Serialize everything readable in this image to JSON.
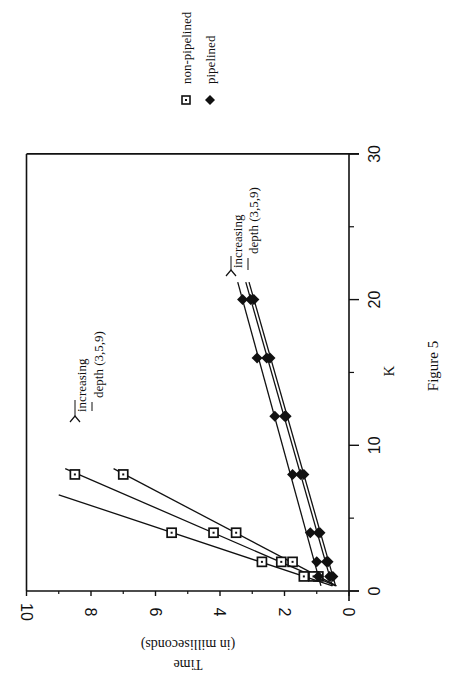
{
  "figure": {
    "caption": "Figure 5",
    "orientation": "rotated 90 degrees clockwise"
  },
  "legend": {
    "items": [
      {
        "label": "non-pipelined",
        "marker": "square-dot-icon"
      },
      {
        "label": "pipelined",
        "marker": "filled-diamond-icon"
      }
    ]
  },
  "annotations": [
    {
      "line1": "increasing",
      "line2": "depth (3,5,9)",
      "target": "non-pipelined"
    },
    {
      "line1": "increasing",
      "line2": "depth (3,5,9)",
      "target": "pipelined"
    }
  ],
  "axes": {
    "x": {
      "label": "K",
      "ticks": [
        "0",
        "10",
        "20",
        "30"
      ]
    },
    "y": {
      "label_line1": "Time",
      "label_line2": "(in milliseconds)",
      "ticks": [
        "0",
        "2",
        "4",
        "6",
        "8",
        "10"
      ]
    }
  },
  "chart_data": {
    "type": "line",
    "title": "Figure 5",
    "xlabel": "K",
    "ylabel": "Time (in milliseconds)",
    "xlim": [
      0,
      30
    ],
    "ylim": [
      0,
      10
    ],
    "x_ticks": [
      0,
      10,
      20,
      30
    ],
    "x_minor_ticks": [
      5,
      15,
      25
    ],
    "y_ticks": [
      0,
      2,
      4,
      6,
      8,
      10
    ],
    "y_minor_ticks": [
      1,
      3,
      5,
      7,
      9
    ],
    "grid": false,
    "legend_position": "top-right (rotated)",
    "series": [
      {
        "name": "non-pipelined, depth 3",
        "marker": "square",
        "x": [
          1,
          2,
          4,
          8
        ],
        "y": [
          0.95,
          1.75,
          3.5,
          7.0
        ],
        "line_extends_to": {
          "x": 8.4,
          "y": 7.3
        }
      },
      {
        "name": "non-pipelined, depth 5",
        "marker": "square",
        "x": [
          1,
          2,
          4,
          8
        ],
        "y": [
          1.1,
          2.1,
          4.2,
          8.5
        ],
        "line_extends_to": {
          "x": 8.4,
          "y": 8.8
        }
      },
      {
        "name": "non-pipelined, depth 9",
        "marker": "square",
        "x": [
          1,
          2,
          4
        ],
        "y": [
          1.4,
          2.7,
          5.5
        ],
        "line_extends_to": {
          "x": 6.6,
          "y": 9.0
        }
      },
      {
        "name": "pipelined, depth 3",
        "marker": "diamond",
        "x": [
          1,
          2,
          4,
          8,
          12,
          16,
          20
        ],
        "y": [
          0.5,
          0.65,
          0.9,
          1.4,
          1.95,
          2.45,
          2.95
        ],
        "line_extends_to": {
          "x": 21.2,
          "y": 3.1
        }
      },
      {
        "name": "pipelined, depth 5",
        "marker": "diamond",
        "x": [
          1,
          2,
          4,
          8,
          12,
          16,
          20
        ],
        "y": [
          0.6,
          0.7,
          0.95,
          1.5,
          2.0,
          2.55,
          3.05
        ],
        "line_extends_to": {
          "x": 21.2,
          "y": 3.2
        }
      },
      {
        "name": "pipelined, depth 9",
        "marker": "diamond",
        "x": [
          1,
          2,
          4,
          8,
          12,
          16,
          20
        ],
        "y": [
          0.95,
          1.0,
          1.2,
          1.75,
          2.3,
          2.85,
          3.3
        ],
        "line_extends_to": {
          "x": 21.2,
          "y": 3.45
        }
      }
    ],
    "annotations": [
      {
        "text": "increasing depth (3,5,9)",
        "near": "non-pipelined lines",
        "at": {
          "x": 10.5,
          "y": 8.6
        }
      },
      {
        "text": "increasing depth (3,5,9)",
        "near": "pipelined lines",
        "at": {
          "x": 24.5,
          "y": 3.5
        }
      }
    ]
  }
}
